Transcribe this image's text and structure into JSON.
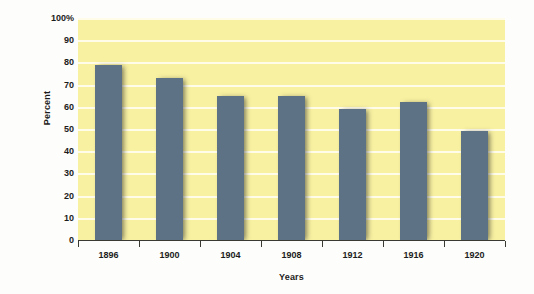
{
  "chart_data": {
    "type": "bar",
    "title": "",
    "categories": [
      "1896",
      "1900",
      "1904",
      "1908",
      "1912",
      "1916",
      "1920"
    ],
    "values": [
      79,
      73,
      65,
      65,
      59,
      62,
      49
    ],
    "xlabel": "Years",
    "ylabel": "Percent",
    "ylim": [
      0,
      100
    ],
    "ytick_labels": [
      "0",
      "10",
      "20",
      "30",
      "40",
      "50",
      "60",
      "70",
      "80",
      "90",
      "100%"
    ],
    "ytick_values": [
      0,
      10,
      20,
      30,
      40,
      50,
      60,
      70,
      80,
      90,
      100
    ],
    "grid": true,
    "legend": null,
    "colors": {
      "bar": "#5d7284",
      "plot_background": "#f8f1a2",
      "gridline": "#fffdf0",
      "axis": "#3a3a32",
      "text": "#1c1c1c",
      "page_background": "#fdfdfb"
    }
  }
}
